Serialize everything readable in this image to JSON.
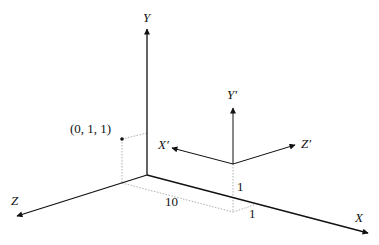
{
  "diagram": {
    "world_axes": {
      "x_label": "X",
      "y_label": "Y",
      "z_label": "Z"
    },
    "local_axes": {
      "x_label": "X′",
      "y_label": "Y′",
      "z_label": "Z′"
    },
    "point_label": "(0, 1, 1)",
    "offsets": {
      "x_offset": "10",
      "y_offset": "1",
      "z_offset": "1"
    },
    "colors": {
      "axis": "#111111",
      "guide": "#999999"
    }
  }
}
